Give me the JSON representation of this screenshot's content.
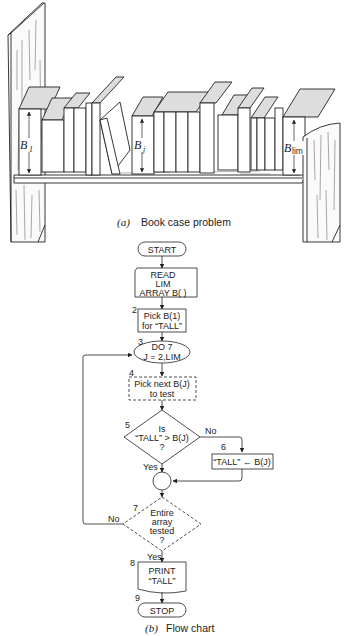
{
  "figure_a": {
    "caption_prefix": "(a)",
    "caption_text": "Book case problem",
    "labels": {
      "b1": "B",
      "b1_sub": "1",
      "bj": "B",
      "bj_sub": "j",
      "blim": "B",
      "blim_sub": "lim"
    }
  },
  "figure_b": {
    "caption_prefix": "(b)",
    "caption_text": "Flow chart",
    "nodes": {
      "start": "START",
      "read_1": "READ",
      "read_2": "LIM",
      "read_3": "ARRAY B( )",
      "n2": "2",
      "pick1_1": "Pick  B(1)",
      "pick1_2": "for “TALL”",
      "n3": "3",
      "do_1": "DO 7",
      "do_2": "J = 2,LIM",
      "n4": "4",
      "pick_next_1": "Pick next B(J)",
      "pick_next_2": "to test",
      "n5": "5",
      "is_1": "Is",
      "is_2": "“TALL” > B(J)",
      "is_3": "?",
      "no1": "No",
      "yes1": "Yes",
      "n6": "6",
      "assign": "“TALL” ← B(J)",
      "n7": "7",
      "entire_1": "Entire",
      "entire_2": "array",
      "entire_3": "tested",
      "entire_4": "?",
      "no2": "No",
      "yes2": "Yes",
      "n8": "8",
      "print_1": "PRINT",
      "print_2": "“TALL”",
      "n9": "9",
      "stop": "STOP"
    }
  }
}
